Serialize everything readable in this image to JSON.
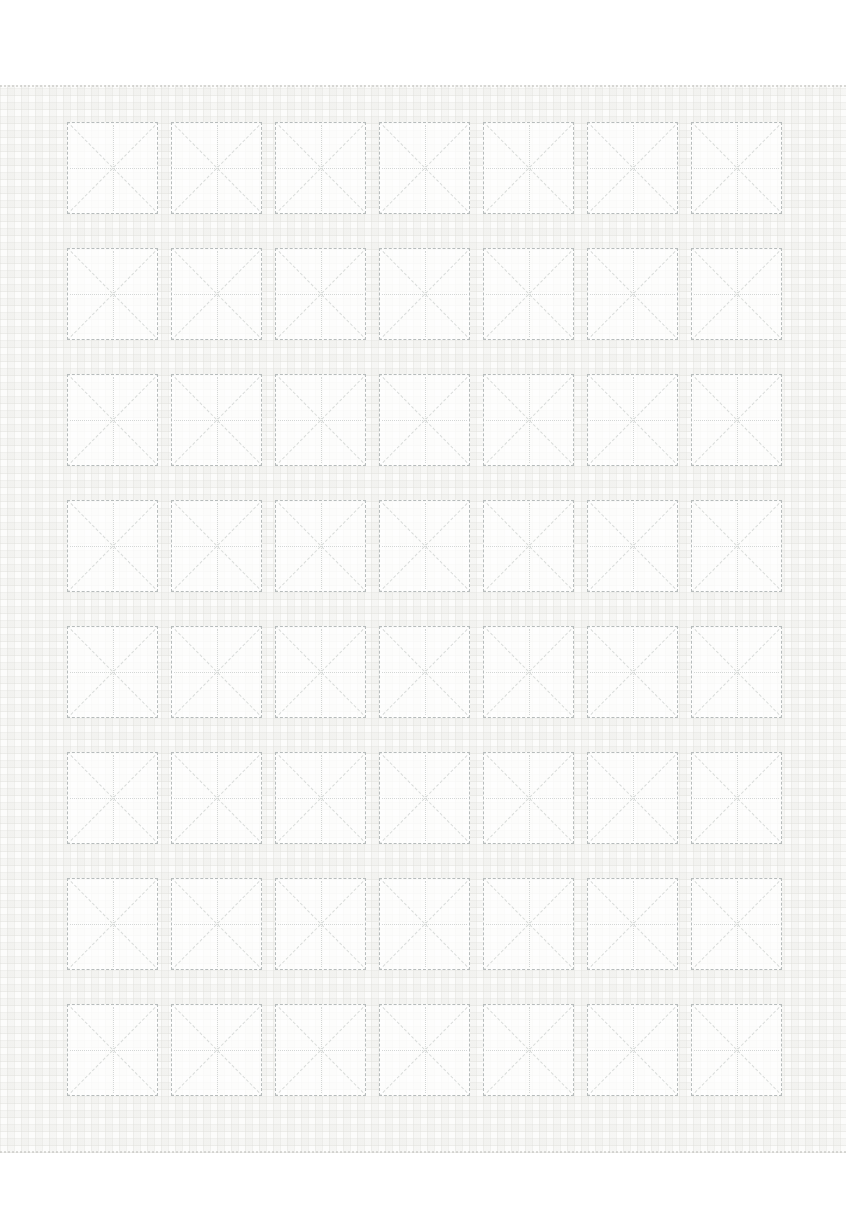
{
  "page": {
    "kind": "blank-chinese-calligraphy-practice-sheet",
    "visible_text": [],
    "background_color": "#ffffff",
    "top_margin_px": 85,
    "bottom_margin_px": 77
  },
  "paper": {
    "texture": "woven-paper",
    "base_color": "#fcfcfb",
    "texture_color": "#e9e9e5"
  },
  "grid": {
    "style": "mi-zi-ge",
    "rows": 8,
    "columns": 7,
    "cell_count": 56,
    "cell_contents": "empty",
    "guides_per_cell": [
      "center-horizontal",
      "center-vertical",
      "diagonal-down",
      "diagonal-up"
    ]
  },
  "colors": {
    "cell_border_color": "#b7bcbc",
    "guide_color": "#d4d7d6",
    "diagonal_color": "#d8dbd9",
    "paper_base": "#fcfcfb"
  }
}
